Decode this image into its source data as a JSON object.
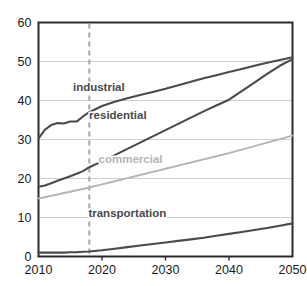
{
  "chart_data": {
    "type": "line",
    "title": "",
    "subtitle": "",
    "xlabel": "",
    "ylabel": "",
    "xlim": [
      2010,
      2050
    ],
    "ylim": [
      0,
      60
    ],
    "x_ticks": [
      2010,
      2020,
      2030,
      2040,
      2050
    ],
    "y_ticks": [
      0,
      10,
      20,
      30,
      40,
      50,
      60
    ],
    "grid": "horizontal",
    "legend_position": "inline-labels",
    "annotations": [
      {
        "name": "projection-divider",
        "type": "vertical-dashed-line",
        "x": 2018,
        "color": "#a8a8a8"
      }
    ],
    "x": [
      2010,
      2011,
      2012,
      2013,
      2014,
      2015,
      2016,
      2017,
      2018,
      2020,
      2022,
      2024,
      2026,
      2028,
      2030,
      2032,
      2034,
      2036,
      2038,
      2040,
      2042,
      2044,
      2046,
      2048,
      2050
    ],
    "series": [
      {
        "name": "industrial",
        "label": "industrial",
        "color": "#4a4a4a",
        "width": 2.1,
        "label_x": 2019.5,
        "label_y": 43.5,
        "values": [
          30.2,
          32.5,
          33.7,
          34.2,
          34.1,
          34.6,
          34.6,
          35.9,
          37.0,
          38.6,
          39.7,
          40.6,
          41.4,
          42.2,
          43.0,
          43.9,
          44.8,
          45.7,
          46.5,
          47.3,
          48.1,
          48.9,
          49.7,
          50.4,
          51.1
        ]
      },
      {
        "name": "residential",
        "label": "residential",
        "color": "#4a4a4a",
        "width": 2.1,
        "label_x": 2022.5,
        "label_y": 36.2,
        "values": [
          17.9,
          18.2,
          18.8,
          19.4,
          20.0,
          20.6,
          21.2,
          21.9,
          22.9,
          24.4,
          26.0,
          27.6,
          29.2,
          30.8,
          32.4,
          34.0,
          35.6,
          37.2,
          38.7,
          40.2,
          42.4,
          44.6,
          46.8,
          48.9,
          50.6
        ]
      },
      {
        "name": "commercial",
        "label": "commercial",
        "color": "#b5b5b5",
        "width": 2.0,
        "label_x": 2024.5,
        "label_y": 25.0,
        "values": [
          14.9,
          15.2,
          15.6,
          15.9,
          16.3,
          16.6,
          17.0,
          17.3,
          17.7,
          18.5,
          19.3,
          20.1,
          20.9,
          21.7,
          22.5,
          23.3,
          24.1,
          24.9,
          25.7,
          26.5,
          27.4,
          28.3,
          29.2,
          30.1,
          31.0
        ]
      },
      {
        "name": "transportation",
        "label": "transportation",
        "color": "#4a4a4a",
        "width": 2.1,
        "label_x": 2024.0,
        "label_y": 11.2,
        "values": [
          1.0,
          1.0,
          1.0,
          1.0,
          1.0,
          1.1,
          1.1,
          1.2,
          1.3,
          1.6,
          2.0,
          2.4,
          2.8,
          3.2,
          3.6,
          4.0,
          4.4,
          4.8,
          5.3,
          5.8,
          6.3,
          6.8,
          7.3,
          7.9,
          8.5
        ]
      }
    ],
    "colors": {
      "axis": "#2b2b2b",
      "gridline": "#cfcfcf",
      "tick_text": "#1a1a1a",
      "background": "#ffffff"
    }
  }
}
